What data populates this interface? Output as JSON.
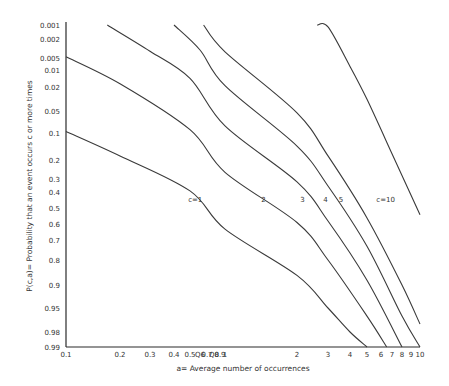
{
  "chart_data": {
    "type": "line",
    "title": "",
    "xlabel": "a= Average number of occurrences",
    "ylabel": "P(c,a)= Probability that an event occurs c or more times",
    "x_scale": "log",
    "y_scale": "probability",
    "xlim": [
      0.1,
      10
    ],
    "ylim": [
      0.001,
      0.99
    ],
    "grid": false,
    "x_ticks": [
      "0.1",
      "0.2",
      "0.3",
      "0.4",
      "0.5",
      "0.6",
      "0.7",
      "0.8",
      "0.9",
      "1",
      "2",
      "3",
      "4",
      "5",
      "6",
      "7",
      "8",
      "9",
      "10"
    ],
    "x_tick_labels": [
      "0.1",
      "0.2",
      "0.3",
      "0.4",
      "0.5",
      "Q6",
      "0.7",
      "Q8",
      "0.9",
      "1",
      "2",
      "3",
      "4",
      "5",
      "6",
      "7",
      "8",
      "9",
      "10"
    ],
    "y_ticks": [
      "0.001",
      "0.002",
      "0.005",
      "0.01",
      "0.02",
      "0.05",
      "0.1",
      "0.2",
      "0.3",
      "0.4",
      "0.5",
      "0.6",
      "0.7",
      "0.8",
      "0.9",
      "0.95",
      "0.98",
      "0.99"
    ],
    "series": [
      {
        "name": "c=1",
        "label": "c=1",
        "x": [
          0.1,
          0.2,
          0.5,
          1,
          2,
          3,
          4,
          5
        ],
        "y": [
          0.095,
          0.18,
          0.39,
          0.63,
          0.86,
          0.95,
          0.98,
          0.99
        ]
      },
      {
        "name": "c=2",
        "label": "2",
        "x": [
          0.1,
          0.2,
          0.5,
          1,
          2,
          3,
          5,
          6.5
        ],
        "y": [
          0.0047,
          0.0175,
          0.09,
          0.26,
          0.59,
          0.8,
          0.96,
          0.99
        ]
      },
      {
        "name": "c=3",
        "label": "3",
        "x": [
          0.17,
          0.3,
          0.5,
          1,
          2,
          3,
          5,
          8
        ],
        "y": [
          0.001,
          0.0036,
          0.014,
          0.08,
          0.32,
          0.58,
          0.88,
          0.99
        ]
      },
      {
        "name": "c=4",
        "label": "4",
        "x": [
          0.4,
          0.6,
          1,
          2,
          3,
          5,
          8,
          10
        ],
        "y": [
          0.001,
          0.0034,
          0.019,
          0.14,
          0.35,
          0.73,
          0.96,
          0.99
        ]
      },
      {
        "name": "c=5",
        "label": "5",
        "x": [
          0.65,
          1,
          2,
          3,
          5,
          8,
          10
        ],
        "y": [
          0.001,
          0.0037,
          0.053,
          0.18,
          0.56,
          0.9,
          0.97
        ]
      },
      {
        "name": "c=10",
        "label": "c=10",
        "x": [
          2.6,
          3,
          4,
          5,
          7,
          10
        ],
        "y": [
          0.001,
          0.0011,
          0.0081,
          0.032,
          0.17,
          0.54
        ]
      }
    ],
    "curve_labels": [
      {
        "text": "c=1",
        "x": 0.55,
        "y": 0.45
      },
      {
        "text": "2",
        "x": 1.45,
        "y": 0.45
      },
      {
        "text": "3",
        "x": 2.15,
        "y": 0.45
      },
      {
        "text": "4",
        "x": 2.9,
        "y": 0.45
      },
      {
        "text": "5",
        "x": 3.55,
        "y": 0.45
      },
      {
        "text": "c=10",
        "x": 6.4,
        "y": 0.45
      }
    ]
  },
  "layout": {
    "plot": {
      "left": 66,
      "right": 420,
      "top": 25,
      "bottom": 347
    },
    "x_px": {
      "0.1": 66,
      "0.2": 120,
      "0.3": 150,
      "0.4": 174,
      "0.5": 190,
      "0.6": 200,
      "0.7": 207,
      "0.8": 214,
      "0.9": 220,
      "1": 225,
      "2": 297,
      "3": 328,
      "4": 350,
      "5": 367,
      "6": 381,
      "7": 392,
      "8": 402,
      "9": 411,
      "10": 420
    },
    "y_px": {
      "0.001": 25,
      "0.002": 39,
      "0.005": 58,
      "0.01": 70,
      "0.02": 87,
      "0.05": 111,
      "0.1": 133,
      "0.2": 160,
      "0.3": 179,
      "0.4": 192,
      "0.5": 208,
      "0.6": 224,
      "0.7": 240,
      "0.8": 260,
      "0.9": 285,
      "0.95": 308,
      "0.98": 332,
      "0.99": 347
    }
  }
}
